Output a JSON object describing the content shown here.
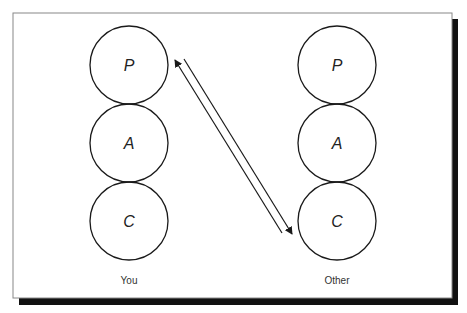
{
  "diagram": {
    "type": "transactional-analysis",
    "columns": [
      {
        "id": "you",
        "label": "You",
        "cx": 129,
        "states": [
          {
            "letter": "P",
            "cy": 65
          },
          {
            "letter": "A",
            "cy": 143
          },
          {
            "letter": "C",
            "cy": 221
          }
        ]
      },
      {
        "id": "other",
        "label": "Other",
        "cx": 337,
        "states": [
          {
            "letter": "P",
            "cy": 65
          },
          {
            "letter": "A",
            "cy": 143
          },
          {
            "letter": "C",
            "cy": 221
          }
        ]
      }
    ],
    "transactions": [
      {
        "from": "Other.C",
        "to": "You.P",
        "direction": "up"
      },
      {
        "from": "You.P",
        "to": "Other.C",
        "direction": "down"
      }
    ],
    "circle_radius": 39,
    "colors": {
      "stroke": "#1a1a1a",
      "frame": "#888888",
      "shadow": "#111111",
      "background": "#ffffff"
    }
  }
}
